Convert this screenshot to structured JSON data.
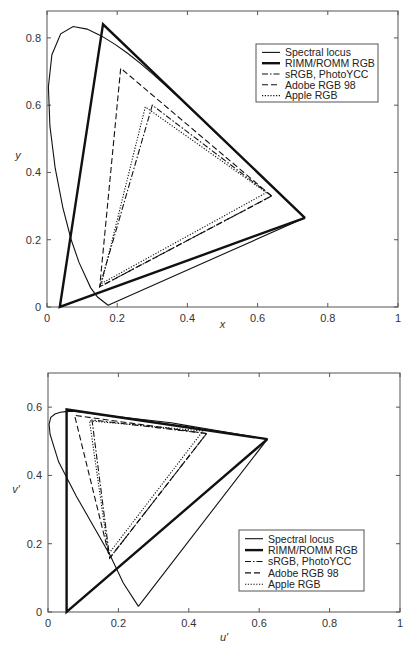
{
  "chart_data": [
    {
      "type": "line",
      "title": "",
      "xlabel": "x",
      "ylabel": "y",
      "xlim": [
        0,
        1
      ],
      "ylim": [
        0,
        0.88
      ],
      "xticks": [
        "0",
        "0.2",
        "0.4",
        "0.6",
        "0.8",
        "1"
      ],
      "yticks": [
        "0",
        "0.2",
        "0.4",
        "0.6",
        "0.8"
      ],
      "grid": false,
      "legend_position": "upper right",
      "legend": [
        "Spectral locus",
        "RIMM/ROMM RGB",
        "sRGB, PhotoYCC",
        "Adobe RGB 98",
        "Apple RGB"
      ],
      "series": [
        {
          "name": "Spectral locus",
          "style": "solid-thin",
          "points": [
            [
              0.1741,
              0.005
            ],
            [
              0.144,
              0.0297
            ],
            [
              0.1241,
              0.0578
            ],
            [
              0.0913,
              0.1327
            ],
            [
              0.0687,
              0.2007
            ],
            [
              0.0454,
              0.295
            ],
            [
              0.0235,
              0.4127
            ],
            [
              0.0082,
              0.5384
            ],
            [
              0.0039,
              0.6548
            ],
            [
              0.0139,
              0.7502
            ],
            [
              0.0389,
              0.812
            ],
            [
              0.0743,
              0.8338
            ],
            [
              0.1142,
              0.8262
            ],
            [
              0.1547,
              0.8059
            ],
            [
              0.1929,
              0.7816
            ],
            [
              0.2296,
              0.7543
            ],
            [
              0.2658,
              0.7243
            ],
            [
              0.3016,
              0.6923
            ],
            [
              0.3373,
              0.6589
            ],
            [
              0.3731,
              0.6245
            ],
            [
              0.4087,
              0.5896
            ],
            [
              0.4441,
              0.5547
            ],
            [
              0.4788,
              0.5202
            ],
            [
              0.5125,
              0.4866
            ],
            [
              0.5448,
              0.4544
            ],
            [
              0.5752,
              0.4242
            ],
            [
              0.6029,
              0.3965
            ],
            [
              0.627,
              0.3725
            ],
            [
              0.6482,
              0.3514
            ],
            [
              0.6658,
              0.334
            ],
            [
              0.6801,
              0.3197
            ],
            [
              0.6915,
              0.3083
            ],
            [
              0.7006,
              0.2993
            ],
            [
              0.7079,
              0.292
            ],
            [
              0.7347,
              0.2653
            ],
            [
              0.1741,
              0.005
            ]
          ]
        },
        {
          "name": "RIMM/ROMM RGB",
          "style": "solid-thick",
          "points": [
            [
              0.7347,
              0.2653
            ],
            [
              0.1596,
              0.8404
            ],
            [
              0.0366,
              0.0001
            ],
            [
              0.7347,
              0.2653
            ]
          ]
        },
        {
          "name": "sRGB, PhotoYCC",
          "style": "dash-dot",
          "points": [
            [
              0.64,
              0.33
            ],
            [
              0.3,
              0.6
            ],
            [
              0.15,
              0.06
            ],
            [
              0.64,
              0.33
            ]
          ]
        },
        {
          "name": "Adobe RGB 98",
          "style": "dashed",
          "points": [
            [
              0.64,
              0.33
            ],
            [
              0.21,
              0.71
            ],
            [
              0.15,
              0.06
            ],
            [
              0.64,
              0.33
            ]
          ]
        },
        {
          "name": "Apple RGB",
          "style": "dotted",
          "points": [
            [
              0.625,
              0.34
            ],
            [
              0.28,
              0.595
            ],
            [
              0.155,
              0.07
            ],
            [
              0.625,
              0.34
            ]
          ]
        }
      ]
    },
    {
      "type": "line",
      "title": "",
      "xlabel": "u′",
      "ylabel": "v′",
      "xlim": [
        0,
        1
      ],
      "ylim": [
        0,
        0.7
      ],
      "xticks": [
        "0",
        "0.2",
        "0.4",
        "0.6",
        "0.8",
        "1"
      ],
      "yticks": [
        "0",
        "0.2",
        "0.4",
        "0.6"
      ],
      "grid": false,
      "legend_position": "lower right",
      "legend": [
        "Spectral locus",
        "RIMM/ROMM RGB",
        "sRGB, PhotoYCC",
        "Adobe RGB 98",
        "Apple RGB"
      ],
      "series": [
        {
          "name": "Spectral locus",
          "style": "solid-thin",
          "points": [
            [
              0.2568,
              0.0165
            ],
            [
              0.214,
              0.085
            ],
            [
              0.1763,
              0.166
            ],
            [
              0.12,
              0.268
            ],
            [
              0.08,
              0.34
            ],
            [
              0.03,
              0.44
            ],
            [
              0.006,
              0.52
            ],
            [
              0.003,
              0.55
            ],
            [
              0.008,
              0.57
            ],
            [
              0.02,
              0.58
            ],
            [
              0.035,
              0.585
            ],
            [
              0.05,
              0.587
            ],
            [
              0.07,
              0.588
            ],
            [
              0.1,
              0.585
            ],
            [
              0.15,
              0.578
            ],
            [
              0.2,
              0.572
            ],
            [
              0.25,
              0.566
            ],
            [
              0.3,
              0.56
            ],
            [
              0.35,
              0.554
            ],
            [
              0.4,
              0.545
            ],
            [
              0.45,
              0.537
            ],
            [
              0.5,
              0.528
            ],
            [
              0.55,
              0.519
            ],
            [
              0.6,
              0.51
            ],
            [
              0.6234,
              0.5065
            ],
            [
              0.2568,
              0.0165
            ]
          ]
        },
        {
          "name": "RIMM/ROMM RGB",
          "style": "solid-thick",
          "points": [
            [
              0.6234,
              0.5065
            ],
            [
              0.0527,
              0.5931
            ],
            [
              0.0528,
              0.0004
            ],
            [
              0.6234,
              0.5065
            ]
          ]
        },
        {
          "name": "sRGB, PhotoYCC",
          "style": "dash-dot",
          "points": [
            [
              0.4507,
              0.5229
            ],
            [
              0.125,
              0.5625
            ],
            [
              0.1754,
              0.1579
            ],
            [
              0.4507,
              0.5229
            ]
          ]
        },
        {
          "name": "Adobe RGB 98",
          "style": "dashed",
          "points": [
            [
              0.4507,
              0.5229
            ],
            [
              0.0757,
              0.5757
            ],
            [
              0.1754,
              0.1579
            ],
            [
              0.4507,
              0.5229
            ]
          ]
        },
        {
          "name": "Apple RGB",
          "style": "dotted",
          "points": [
            [
              0.44,
              0.53
            ],
            [
              0.118,
              0.56
            ],
            [
              0.172,
              0.17
            ],
            [
              0.44,
              0.53
            ]
          ]
        }
      ]
    }
  ]
}
